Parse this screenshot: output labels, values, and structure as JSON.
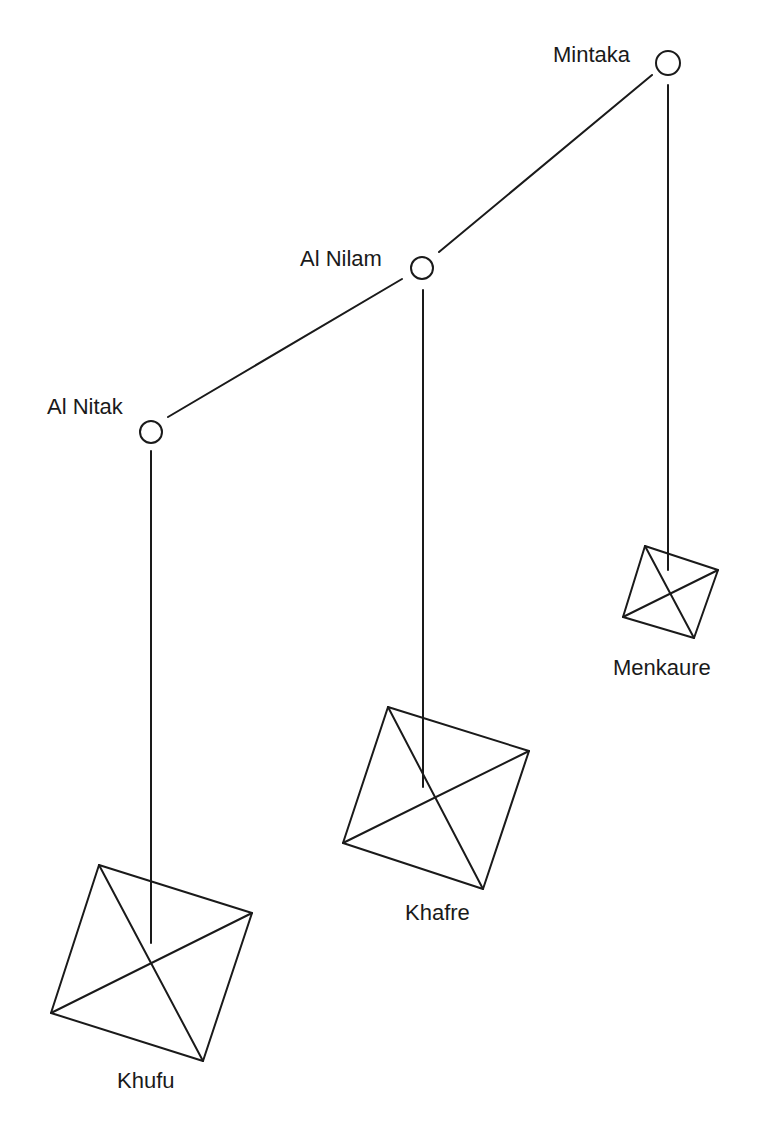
{
  "stars": [
    {
      "name": "Mintaka",
      "cx": 668,
      "cy": 63,
      "r": 12,
      "label_x": 553,
      "label_y": 62
    },
    {
      "name": "Al Nilam",
      "cx": 422,
      "cy": 268,
      "r": 11,
      "label_x": 300,
      "label_y": 266
    },
    {
      "name": "Al Nitak",
      "cx": 151,
      "cy": 432,
      "r": 11,
      "label_x": 47,
      "label_y": 414
    }
  ],
  "pyramids": [
    {
      "name": "Menkaure",
      "points": "645,546 718,570 694,638 623,617",
      "label_x": 613,
      "label_y": 675
    },
    {
      "name": "Khafre",
      "points": "388,707 529,751 483,889 343,843",
      "label_x": 405,
      "label_y": 920
    },
    {
      "name": "Khufu",
      "points": "99,865 252,913 203,1061 51,1013",
      "label_x": 117,
      "label_y": 1088
    }
  ],
  "connections": {
    "belt": [
      {
        "from": "Mintaka",
        "to": "Al Nilam"
      },
      {
        "from": "Al Nilam",
        "to": "Al Nitak"
      }
    ],
    "drops": [
      {
        "star": "Mintaka",
        "pyramid": "Menkaure"
      },
      {
        "star": "Al Nilam",
        "pyramid": "Khafre"
      },
      {
        "star": "Al Nitak",
        "pyramid": "Khufu"
      }
    ]
  },
  "colors": {
    "line": "#1a1a1a",
    "background": "#ffffff"
  }
}
